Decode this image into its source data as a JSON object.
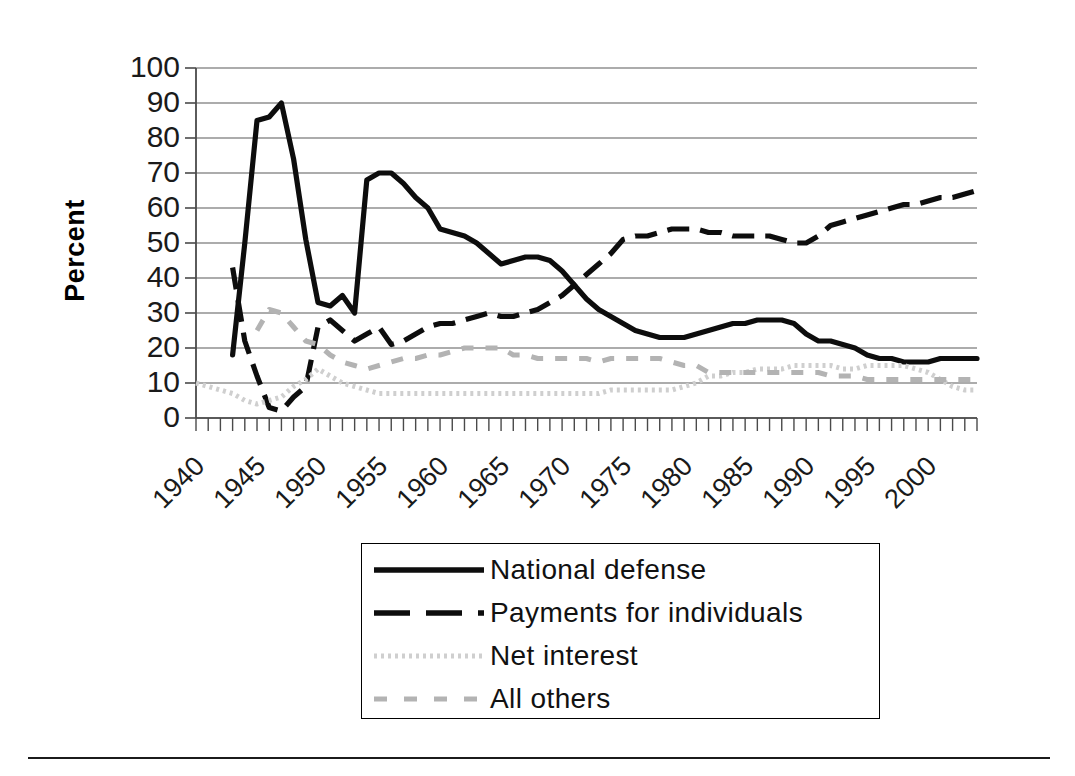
{
  "axis": {
    "ylabel": "Percent",
    "yticks": [
      "100",
      "90",
      "80",
      "70",
      "60",
      "50",
      "40",
      "30",
      "20",
      "10",
      "0"
    ],
    "xticks": [
      "1940",
      "1945",
      "1950",
      "1955",
      "1960",
      "1965",
      "1970",
      "1975",
      "1980",
      "1985",
      "1990",
      "1995",
      "2000"
    ]
  },
  "legend": {
    "items": [
      {
        "label": "National defense",
        "key": "solid-black-line",
        "color": "#0d0d0d"
      },
      {
        "label": "Payments for individuals",
        "key": "dashed-black-line",
        "color": "#0d0d0d"
      },
      {
        "label": "Net interest",
        "key": "dotted-light-gray-line",
        "color": "#cfcfcf"
      },
      {
        "label": "All others",
        "key": "dashed-gray-line",
        "color": "#b3b3b3"
      }
    ]
  },
  "chart_data": {
    "type": "line",
    "title": "",
    "xlabel": "",
    "ylabel": "Percent",
    "xlim": [
      1940,
      2004
    ],
    "ylim": [
      0,
      100
    ],
    "grid": true,
    "legend_position": "bottom",
    "x": [
      1940,
      1941,
      1942,
      1943,
      1944,
      1945,
      1946,
      1947,
      1948,
      1949,
      1950,
      1951,
      1952,
      1953,
      1954,
      1955,
      1956,
      1957,
      1958,
      1959,
      1960,
      1961,
      1962,
      1963,
      1964,
      1965,
      1966,
      1967,
      1968,
      1969,
      1970,
      1971,
      1972,
      1973,
      1974,
      1975,
      1976,
      1977,
      1978,
      1979,
      1980,
      1981,
      1982,
      1983,
      1984,
      1985,
      1986,
      1987,
      1988,
      1989,
      1990,
      1991,
      1992,
      1993,
      1994,
      1995,
      1996,
      1997,
      1998,
      1999,
      2000,
      2001,
      2002,
      2003,
      2004
    ],
    "series": [
      {
        "name": "National defense",
        "style": "solid",
        "color": "#0d0d0d",
        "values": [
          null,
          null,
          null,
          18,
          50,
          85,
          86,
          90,
          74,
          51,
          33,
          32,
          35,
          30,
          68,
          70,
          70,
          67,
          63,
          60,
          54,
          53,
          52,
          50,
          47,
          44,
          45,
          46,
          46,
          45,
          42,
          38,
          34,
          31,
          29,
          27,
          25,
          24,
          23,
          23,
          23,
          24,
          25,
          26,
          27,
          27,
          28,
          28,
          28,
          27,
          24,
          22,
          22,
          21,
          20,
          18,
          17,
          17,
          16,
          16,
          16,
          17,
          17,
          17,
          17
        ]
      },
      {
        "name": "Payments for individuals",
        "style": "dashed",
        "color": "#0d0d0d",
        "values": [
          null,
          null,
          null,
          43,
          22,
          12,
          3,
          2,
          6,
          9,
          26,
          28,
          25,
          22,
          24,
          26,
          21,
          22,
          24,
          26,
          27,
          27,
          28,
          29,
          30,
          29,
          29,
          30,
          31,
          33,
          35,
          38,
          41,
          44,
          47,
          51,
          52,
          52,
          53,
          54,
          54,
          54,
          53,
          53,
          52,
          52,
          52,
          52,
          51,
          50,
          50,
          52,
          55,
          56,
          57,
          58,
          59,
          60,
          61,
          61,
          62,
          63,
          63,
          64,
          65
        ]
      },
      {
        "name": "Net interest",
        "style": "dotted",
        "color": "#cfcfcf",
        "values": [
          10,
          9,
          8,
          7,
          5,
          4,
          5,
          6,
          9,
          11,
          14,
          12,
          10,
          9,
          8,
          7,
          7,
          7,
          7,
          7,
          7,
          7,
          7,
          7,
          7,
          7,
          7,
          7,
          7,
          7,
          7,
          7,
          7,
          7,
          8,
          8,
          8,
          8,
          8,
          8,
          9,
          10,
          12,
          12,
          13,
          13,
          14,
          14,
          14,
          15,
          15,
          15,
          15,
          14,
          14,
          15,
          15,
          15,
          15,
          14,
          13,
          11,
          9,
          8,
          8
        ]
      },
      {
        "name": "All others",
        "style": "dashed",
        "color": "#b3b3b3",
        "values": [
          null,
          null,
          null,
          null,
          null,
          25,
          31,
          30,
          26,
          22,
          21,
          18,
          16,
          15,
          14,
          15,
          16,
          17,
          17,
          18,
          18,
          19,
          20,
          20,
          20,
          20,
          18,
          18,
          17,
          17,
          17,
          17,
          17,
          16,
          17,
          17,
          17,
          17,
          17,
          16,
          15,
          15,
          13,
          13,
          13,
          13,
          13,
          13,
          13,
          13,
          13,
          13,
          12,
          12,
          12,
          11,
          11,
          11,
          11,
          11,
          11,
          11,
          11,
          11,
          11
        ]
      }
    ]
  }
}
